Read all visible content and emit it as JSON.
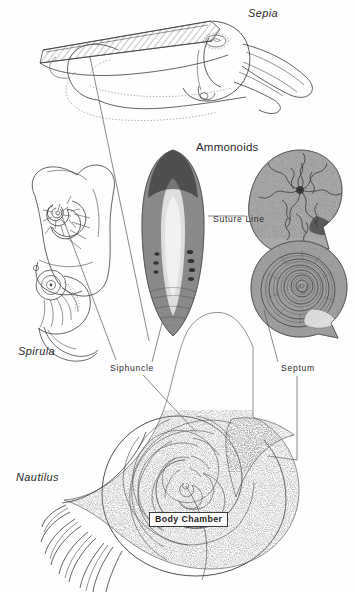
{
  "figure": {
    "background_color": "#ffffff",
    "ink_color": "#3b3b3b"
  },
  "specimens": [
    {
      "id": "sepia",
      "label": "Sepia",
      "common": "cuttlefish",
      "style": "italic",
      "label_x": 248,
      "label_y": 14,
      "rendering": "line-drawing-with-hatched-cuttlebone"
    },
    {
      "id": "spirula",
      "label": "Spirula",
      "style": "italic",
      "label_x": 18,
      "label_y": 352,
      "rendering": "line-drawing-with-internal-coiled-shell"
    },
    {
      "id": "ammonoids",
      "label": "Ammonoids",
      "style": "roman",
      "label_x": 196,
      "label_y": 148,
      "rendering": "two-stippled-fossil-specimens"
    },
    {
      "id": "nautilus",
      "label": "Nautilus",
      "style": "italic",
      "label_x": 16,
      "label_y": 478,
      "rendering": "sectioned-spiral-shell-with-stippled-body"
    }
  ],
  "part_labels": [
    {
      "id": "suture-line",
      "text": "Suture  Line",
      "x": 213,
      "y": 219,
      "points_to": [
        "ammonoid-upper"
      ]
    },
    {
      "id": "siphuncle",
      "text": "Siphuncle",
      "x": 110,
      "y": 368,
      "points_to": [
        "spirula-shell",
        "sepia-cuttlebone-section",
        "nautilus-siphuncle"
      ]
    },
    {
      "id": "septum",
      "text": "Septum",
      "x": 281,
      "y": 368,
      "points_to": [
        "ammonoid-lower",
        "nautilus-septum"
      ]
    },
    {
      "id": "body-chamber",
      "text": "Body Chamber",
      "x": 149,
      "y": 513,
      "boxed": true,
      "points_to": [
        "nautilus-body-chamber"
      ]
    }
  ],
  "central_specimen": {
    "id": "sepia-cuttlebone-section",
    "description": "Sepia cuttlebone ventral view",
    "x": 134,
    "y": 148,
    "width": 78,
    "height": 188
  }
}
